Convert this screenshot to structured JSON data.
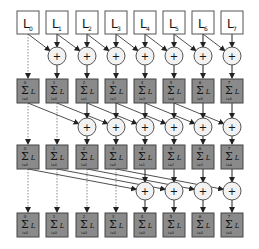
{
  "diagram": {
    "columns": 8,
    "col_x": [
      28,
      57,
      87,
      116,
      145,
      174,
      203,
      232
    ],
    "colors": {
      "input_fill": "#ffffff",
      "input_stroke": "#555555",
      "sum_fill": "#8a8a8a",
      "sum_stroke": "#444444",
      "plus_fill": "#f2f2f2",
      "plus_stroke": "#555555",
      "arrow": "#222222",
      "dotted": "#888888"
    },
    "inputs": [
      {
        "letter": "L",
        "sub": "0"
      },
      {
        "letter": "L",
        "sub": "1"
      },
      {
        "letter": "L",
        "sub": "2"
      },
      {
        "letter": "L",
        "sub": "3"
      },
      {
        "letter": "L",
        "sub": "4"
      },
      {
        "letter": "L",
        "sub": "5"
      },
      {
        "letter": "L",
        "sub": "6"
      },
      {
        "letter": "L",
        "sub": "7"
      }
    ],
    "plus_symbol": "+",
    "sum_symbol": "Σ",
    "sum_var": "L",
    "stages": [
      {
        "offset": 1,
        "box_top": 79,
        "plus_y": 56,
        "src_bottom": 34,
        "sums": [
          {
            "upper": "0",
            "lower": "i=0"
          },
          {
            "upper": "1",
            "lower": "i=0"
          },
          {
            "upper": "2",
            "lower": "i=1"
          },
          {
            "upper": "3",
            "lower": "i=2"
          },
          {
            "upper": "4",
            "lower": "i=3"
          },
          {
            "upper": "5",
            "lower": "i=4"
          },
          {
            "upper": "6",
            "lower": "i=5"
          },
          {
            "upper": "7",
            "lower": "i=6"
          }
        ]
      },
      {
        "offset": 2,
        "box_top": 145,
        "plus_y": 127,
        "src_bottom": 103,
        "sums": [
          {
            "upper": "0",
            "lower": "i=0"
          },
          {
            "upper": "1",
            "lower": "i=0"
          },
          {
            "upper": "2",
            "lower": "i=0"
          },
          {
            "upper": "3",
            "lower": "i=0"
          },
          {
            "upper": "4",
            "lower": "i=1"
          },
          {
            "upper": "5",
            "lower": "i=2"
          },
          {
            "upper": "6",
            "lower": "i=3"
          },
          {
            "upper": "7",
            "lower": "i=4"
          }
        ]
      },
      {
        "offset": 4,
        "box_top": 213,
        "plus_y": 191,
        "src_bottom": 169,
        "sums": [
          {
            "upper": "0",
            "lower": "i=0"
          },
          {
            "upper": "1",
            "lower": "i=0"
          },
          {
            "upper": "2",
            "lower": "i=0"
          },
          {
            "upper": "3",
            "lower": "i=0"
          },
          {
            "upper": "4",
            "lower": "i=0"
          },
          {
            "upper": "5",
            "lower": "i=0"
          },
          {
            "upper": "6",
            "lower": "i=0"
          },
          {
            "upper": "7",
            "lower": "i=0"
          }
        ]
      }
    ]
  }
}
